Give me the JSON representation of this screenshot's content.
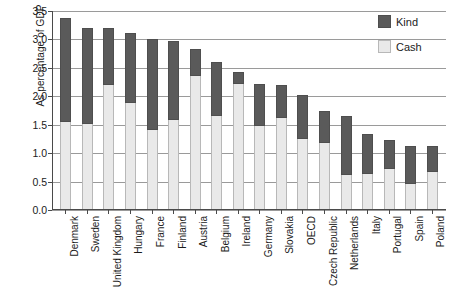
{
  "chart_data": {
    "type": "bar",
    "stacked": true,
    "title": "",
    "xlabel": "",
    "ylabel": "As percentage of GDP",
    "ylim": [
      0.0,
      3.5
    ],
    "ytick_labels": [
      "0.0",
      "0.5",
      "1.0",
      "1.5",
      "2.0",
      "2.5",
      "3.0",
      "3.5"
    ],
    "ytick_values": [
      0.0,
      0.5,
      1.0,
      1.5,
      2.0,
      2.5,
      3.0,
      3.5
    ],
    "grid": "horizontal",
    "legend_position": "top-right",
    "categories": [
      "Denmark",
      "Sweden",
      "United Kingdom",
      "Hungary",
      "France",
      "Finland",
      "Austria",
      "Belgium",
      "Ireland",
      "Germany",
      "Slovakia",
      "OECD",
      "Czech Republic",
      "Netherlands",
      "Italy",
      "Portugal",
      "Spain",
      "Poland"
    ],
    "series": [
      {
        "name": "Cash",
        "color": "#e9e9e9",
        "values": [
          1.55,
          1.52,
          2.2,
          1.88,
          1.4,
          1.58,
          2.35,
          1.65,
          2.22,
          1.48,
          1.62,
          1.25,
          1.18,
          0.62,
          0.63,
          0.73,
          0.45,
          0.67
        ]
      },
      {
        "name": "Kind",
        "color": "#5a5a5a",
        "values": [
          1.83,
          1.69,
          1.0,
          1.23,
          1.61,
          1.39,
          0.48,
          0.95,
          0.2,
          0.74,
          0.58,
          0.77,
          0.57,
          1.03,
          0.71,
          0.5,
          0.68,
          0.45
        ]
      }
    ],
    "totals": [
      3.38,
      3.21,
      3.2,
      3.11,
      3.01,
      2.97,
      2.83,
      2.6,
      2.42,
      2.22,
      2.2,
      2.02,
      1.75,
      1.65,
      1.34,
      1.23,
      1.13,
      1.12
    ]
  },
  "legend": {
    "items": [
      {
        "label": "Kind"
      },
      {
        "label": "Cash"
      }
    ]
  }
}
